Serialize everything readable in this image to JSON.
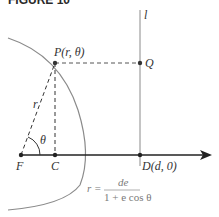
{
  "figure": {
    "title": "FIGURE 10"
  },
  "labels": {
    "point_p": "P(r, θ)",
    "point_q": "Q",
    "directrix": "l",
    "focus": "F",
    "point_c": "C",
    "point_d": "D(d, 0)",
    "radius": "r",
    "angle": "θ"
  },
  "formula": {
    "lhs": "r =",
    "numerator": "de",
    "denominator": "1 + e cos θ"
  },
  "colors": {
    "curve": "#8a8a8a",
    "axis": "#222222",
    "directrix": "#8a8a8a",
    "dashed": "#555555",
    "formula": "#7a7a7a"
  }
}
